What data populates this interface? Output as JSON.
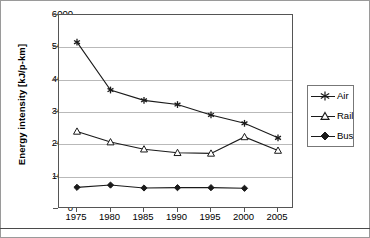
{
  "chart_data": {
    "type": "line",
    "title": "",
    "xlabel": "",
    "ylabel": "Energy intensity [kJ/p-km]",
    "x": [
      1975,
      1980,
      1985,
      1990,
      1995,
      2000,
      2005
    ],
    "xticklabels": [
      "1975",
      "1980",
      "1985",
      "1990",
      "1995",
      "2000",
      "2005"
    ],
    "yticklabels": [
      "0",
      "1000",
      "2000",
      "3000",
      "4000",
      "5000",
      "6000"
    ],
    "yticks": [
      0,
      1000,
      2000,
      3000,
      4000,
      5000,
      6000
    ],
    "ylim": [
      0,
      6000
    ],
    "grid": "horizontal",
    "legend_position": "right",
    "series": [
      {
        "name": "Air",
        "marker": "asterisk",
        "x": [
          1975,
          1980,
          1985,
          1990,
          1995,
          2000,
          2005
        ],
        "values": [
          5160,
          3680,
          3360,
          3230,
          2910,
          2650,
          2200
        ]
      },
      {
        "name": "Rail",
        "marker": "open-triangle",
        "x": [
          1975,
          1980,
          1985,
          1990,
          1995,
          2000,
          2005
        ],
        "values": [
          2400,
          2070,
          1850,
          1740,
          1720,
          2230,
          1810
        ]
      },
      {
        "name": "Bus",
        "marker": "filled-diamond",
        "x": [
          1975,
          1980,
          1985,
          1990,
          1995,
          2000
        ],
        "values": [
          670,
          740,
          650,
          660,
          660,
          640
        ]
      }
    ],
    "colors": {
      "line": "#1a1a1a",
      "grid": "#b9b9b9",
      "axis": "#555555",
      "background": "#ffffff"
    }
  },
  "legend": {
    "items": [
      {
        "label": "Air"
      },
      {
        "label": "Rail"
      },
      {
        "label": "Bus"
      }
    ]
  }
}
